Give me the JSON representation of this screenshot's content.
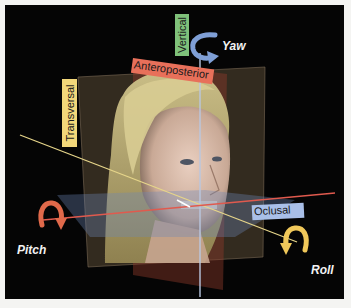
{
  "diagram": {
    "planes": [
      {
        "name": "Transversal",
        "color": "#f2d77a"
      },
      {
        "name": "Vertical",
        "color": "#7fc17a"
      },
      {
        "name": "Anteroposterior",
        "color": "#e8705a"
      },
      {
        "name": "Oclusal",
        "color": "#a9bfe8"
      }
    ],
    "rotations": [
      {
        "name": "Yaw",
        "arrow_color": "#7f9fd6"
      },
      {
        "name": "Pitch",
        "arrow_color": "#e0694a"
      },
      {
        "name": "Roll",
        "arrow_color": "#f0c85a"
      }
    ],
    "background_color": "#050505"
  }
}
